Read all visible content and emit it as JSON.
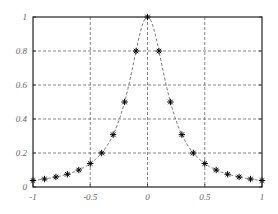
{
  "chart_data": {
    "type": "line",
    "title": "",
    "xlabel": "",
    "ylabel": "",
    "xlim": [
      -1,
      1
    ],
    "ylim": [
      0,
      1
    ],
    "grid": true,
    "legend": null,
    "x_ticks": [
      -1,
      -0.5,
      0,
      0.5,
      1
    ],
    "x_tick_labels": [
      "-1",
      "-0.5",
      "0",
      "0.5",
      "1"
    ],
    "y_ticks": [
      0,
      0.2,
      0.4,
      0.6,
      0.8,
      1
    ],
    "y_tick_labels": [
      "0",
      "0.2",
      "0.4",
      "0.6",
      "0.8",
      "1"
    ],
    "series": [
      {
        "name": "f(x) = 1/(1+25x^2)",
        "style": "dashed-line",
        "color": "#555555",
        "x": "continuous -1..1",
        "function": "runge"
      },
      {
        "name": "samples",
        "style": "asterisk-markers",
        "color": "#000000",
        "x": [
          -1,
          -0.9,
          -0.8,
          -0.7,
          -0.6,
          -0.5,
          -0.4,
          -0.3,
          -0.2,
          -0.1,
          0,
          0.1,
          0.2,
          0.3,
          0.4,
          0.5,
          0.6,
          0.7,
          0.8,
          0.9,
          1
        ],
        "y": [
          0.038,
          0.047,
          0.059,
          0.075,
          0.1,
          0.138,
          0.2,
          0.308,
          0.5,
          0.8,
          1,
          0.8,
          0.5,
          0.308,
          0.2,
          0.138,
          0.1,
          0.075,
          0.059,
          0.047,
          0.038
        ]
      }
    ]
  },
  "colors": {
    "axis": "#222222",
    "grid": "#666666",
    "curve": "#555555",
    "marker": "#000000",
    "tick_text": "#666666"
  }
}
